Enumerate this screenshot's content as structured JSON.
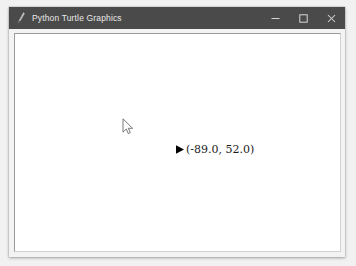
{
  "window": {
    "title": "Python Turtle Graphics",
    "icon": "turtle-pen-icon",
    "titlebar_color": "#4a4a4a",
    "title_text_color": "#e8e8e8",
    "controls": {
      "minimize_label": "—",
      "minimize_icon": "minimize-icon",
      "maximize_label": "□",
      "maximize_icon": "maximize-icon",
      "close_label": "✕",
      "close_icon": "close-icon"
    }
  },
  "canvas": {
    "background_color": "#ffffff",
    "turtle": {
      "shape": "arrow",
      "color": "#000000",
      "heading_label": "east",
      "coordinate_text": "(-89.0,  52.0)",
      "x": -89.0,
      "y": 52.0
    },
    "cursor": {
      "icon": "mouse-pointer-icon"
    }
  }
}
